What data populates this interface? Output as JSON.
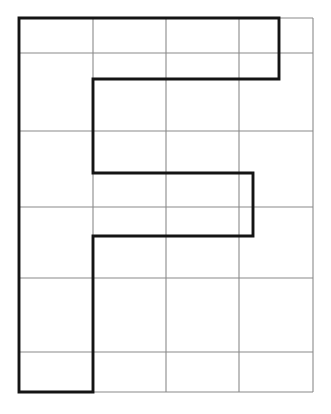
{
  "figure": {
    "title": "Grid with bold polygon outline",
    "type": "geometry-grid-figure",
    "background_color": "#ffffff",
    "grid_color": "#8a8a8a",
    "shape_color": "#141414",
    "grid_line_width": 1.1,
    "shape_line_width": 2.9,
    "canvas": {
      "width": 331,
      "height": 414
    },
    "grid": {
      "columns": 4,
      "rows": 6,
      "x_positions": [
        19,
        93,
        166,
        239,
        313
      ],
      "y_positions": [
        18,
        53,
        131,
        207,
        278,
        352,
        392
      ],
      "column_widths": [
        74,
        73,
        73,
        74
      ],
      "row_heights": [
        35,
        78,
        76,
        71,
        74,
        40
      ],
      "vertical_lines": [
        {
          "name": "grid-v-0",
          "x": 19,
          "y1": 18,
          "y2": 392
        },
        {
          "name": "grid-v-1",
          "x": 93,
          "y1": 18,
          "y2": 392
        },
        {
          "name": "grid-v-2",
          "x": 166,
          "y1": 18,
          "y2": 392
        },
        {
          "name": "grid-v-3",
          "x": 239,
          "y1": 18,
          "y2": 392
        },
        {
          "name": "grid-v-4",
          "x": 313,
          "y1": 18,
          "y2": 392
        }
      ],
      "horizontal_lines": [
        {
          "name": "grid-h-0",
          "y": 18,
          "x1": 19,
          "x2": 313
        },
        {
          "name": "grid-h-1",
          "y": 53,
          "x1": 19,
          "x2": 313
        },
        {
          "name": "grid-h-2",
          "y": 131,
          "x1": 19,
          "x2": 313
        },
        {
          "name": "grid-h-3",
          "y": 207,
          "x1": 19,
          "x2": 313
        },
        {
          "name": "grid-h-4",
          "y": 278,
          "x1": 19,
          "x2": 313
        },
        {
          "name": "grid-h-5",
          "y": 352,
          "x1": 19,
          "x2": 313
        },
        {
          "name": "grid-h-6",
          "y": 392,
          "x1": 19,
          "x2": 313
        }
      ]
    },
    "shape": {
      "name": "bold-outline-polygon",
      "closed": true,
      "description": "Letter-F-like stepped polygon drawn in heavy black over the light grid",
      "vertices": [
        [
          19,
          18
        ],
        [
          279,
          18
        ],
        [
          279,
          79
        ],
        [
          93,
          79
        ],
        [
          93,
          173
        ],
        [
          253,
          173
        ],
        [
          253,
          236
        ],
        [
          93,
          236
        ],
        [
          93,
          392
        ],
        [
          19,
          392
        ]
      ],
      "path_d": "M 19 18 L 279 18 L 279 79 L 93 79 L 93 173 L 253 173 L 253 236 L 93 236 L 93 392 L 19 392 Z"
    }
  }
}
